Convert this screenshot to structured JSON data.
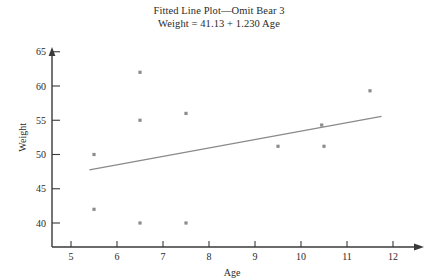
{
  "title": {
    "line1": "Fitted Line Plot—Omit Bear 3",
    "line2": "Weight = 41.13 + 1.230 Age"
  },
  "chart_data": {
    "type": "scatter",
    "title": "Fitted Line Plot—Omit Bear 3",
    "subtitle": "Weight = 41.13 + 1.230 Age",
    "xlabel": "Age",
    "ylabel": "Weight",
    "xlim": [
      4.6,
      12.4
    ],
    "ylim": [
      37.5,
      66.5
    ],
    "xticks": [
      5,
      6,
      7,
      8,
      9,
      10,
      11,
      12
    ],
    "xtick_labels": [
      "5",
      "6",
      "7",
      "8",
      "9",
      "10",
      "11",
      "12"
    ],
    "yticks": [
      40,
      45,
      50,
      55,
      60,
      65
    ],
    "ytick_labels": [
      "40",
      "45",
      "50",
      "55",
      "60",
      "65"
    ],
    "grid": false,
    "legend": false,
    "marker_color": "#8c8c8c",
    "line_color": "#8a8a8a",
    "axis_color": "#3a3a3a",
    "points": [
      {
        "x": 5.5,
        "y": 50.0
      },
      {
        "x": 5.5,
        "y": 42.0
      },
      {
        "x": 6.5,
        "y": 62.0
      },
      {
        "x": 6.5,
        "y": 55.0
      },
      {
        "x": 6.5,
        "y": 40.0
      },
      {
        "x": 7.5,
        "y": 56.0
      },
      {
        "x": 7.5,
        "y": 40.0
      },
      {
        "x": 9.5,
        "y": 51.2
      },
      {
        "x": 10.45,
        "y": 54.3
      },
      {
        "x": 10.5,
        "y": 51.2
      },
      {
        "x": 11.5,
        "y": 59.3
      }
    ],
    "fit_line": {
      "equation": "Weight = 41.13 + 1.230 Age",
      "intercept": 41.13,
      "slope": 1.23,
      "x_start": 5.4,
      "x_end": 11.75,
      "y_start": 47.77,
      "y_end": 55.58
    }
  }
}
